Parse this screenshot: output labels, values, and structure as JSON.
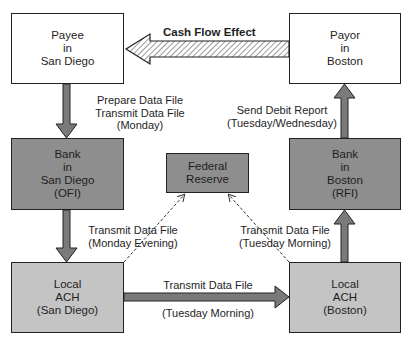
{
  "diagram": {
    "type": "ach-payment-flow",
    "colors": {
      "white_box": "#ffffff",
      "bank_box": "#8e8e8e",
      "ach_box": "#c4c4c4",
      "arrow_fill": "#7a7a7a",
      "border": "#222222"
    },
    "nodes": {
      "payee": {
        "lines": [
          "Payee",
          "in",
          "San Diego"
        ]
      },
      "payor": {
        "lines": [
          "Payor",
          "in",
          "Boston"
        ]
      },
      "bank_sd": {
        "lines": [
          "Bank",
          "in",
          "San Diego",
          "(OFI)"
        ]
      },
      "federal_reserve": {
        "lines": [
          "Federal",
          "Reserve"
        ]
      },
      "bank_boston": {
        "lines": [
          "Bank",
          "in",
          "Boston",
          "(RFI)"
        ]
      },
      "ach_sd": {
        "lines": [
          "Local",
          "ACH",
          "(San Diego)"
        ]
      },
      "ach_boston": {
        "lines": [
          "Local",
          "ACH",
          "(Boston)"
        ]
      }
    },
    "edges": {
      "cash_flow": {
        "label": "Cash Flow Effect"
      },
      "payee_to_bank": {
        "lines": [
          "Prepare Data File",
          "Transmit Data File",
          "(Monday)"
        ]
      },
      "bank_to_ach_sd": {
        "lines": [
          "Transmit Data File",
          "(Monday Evening)"
        ]
      },
      "ach_to_ach": {
        "top": "Transmit Data File",
        "bottom": "(Tuesday Morning)"
      },
      "ach_boston_to_bank": {
        "lines": [
          "Transmit Data File",
          "(Tuesday Morning)"
        ]
      },
      "bank_to_payor": {
        "lines": [
          "Send Debit Report",
          "(Tuesday/Wednesday)"
        ]
      }
    }
  }
}
